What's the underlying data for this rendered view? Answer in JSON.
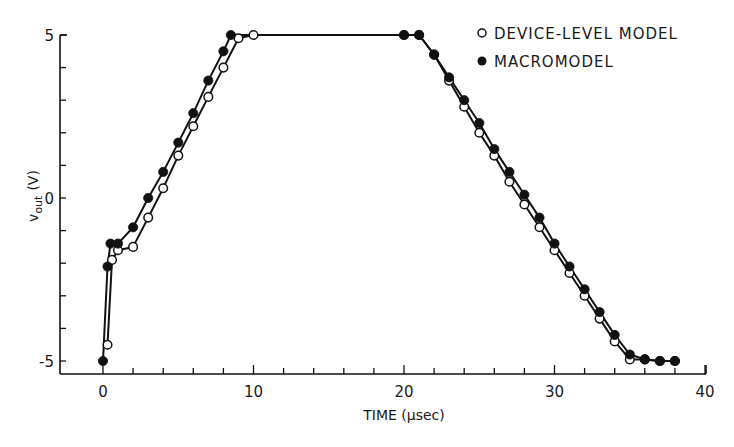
{
  "chart_data": {
    "type": "line",
    "title": "",
    "xlabel": "TIME (μsec)",
    "ylabel": "vout (V)",
    "ylabel_main": "v",
    "ylabel_sub": "out",
    "ylabel_unit": "(V)",
    "xlim": [
      0,
      40
    ],
    "ylim": [
      -5,
      5
    ],
    "x_ticks": [
      0,
      10,
      20,
      30,
      40
    ],
    "x_tick_labels": [
      "0",
      "10",
      "20",
      "30",
      "40"
    ],
    "x_minor_step": 2,
    "y_ticks": [
      -5,
      0,
      5
    ],
    "y_tick_labels": [
      "-5",
      "0",
      "5"
    ],
    "y_minor_step": 1,
    "grid": false,
    "legend_position": "upper right",
    "series": [
      {
        "name": "DEVICE-LEVEL MODEL",
        "marker": "open-circle",
        "x": [
          0.3,
          0.6,
          1,
          2,
          3,
          4,
          5,
          6,
          7,
          8,
          9,
          10,
          20,
          21,
          22,
          23,
          24,
          25,
          26,
          27,
          28,
          29,
          30,
          31,
          32,
          33,
          34,
          35,
          36,
          37,
          38
        ],
        "y": [
          -4.5,
          -1.9,
          -1.6,
          -1.5,
          -0.6,
          0.3,
          1.3,
          2.2,
          3.1,
          4.0,
          4.9,
          5.0,
          5.0,
          5.0,
          4.4,
          3.6,
          2.8,
          2.0,
          1.3,
          0.5,
          -0.2,
          -0.9,
          -1.6,
          -2.3,
          -3.0,
          -3.7,
          -4.4,
          -4.95,
          -4.95,
          -5.0,
          -5.0
        ]
      },
      {
        "name": "MACROMODEL",
        "marker": "filled-circle",
        "x": [
          0,
          0.3,
          0.5,
          1,
          2,
          3,
          4,
          5,
          6,
          7,
          8,
          8.5,
          20,
          21,
          22,
          23,
          24,
          25,
          26,
          27,
          28,
          29,
          30,
          31,
          32,
          33,
          34,
          35,
          36,
          37,
          38
        ],
        "y": [
          -5.0,
          -2.1,
          -1.4,
          -1.4,
          -0.9,
          0.0,
          0.8,
          1.7,
          2.6,
          3.6,
          4.5,
          5.0,
          5.0,
          5.0,
          4.4,
          3.7,
          3.0,
          2.3,
          1.5,
          0.8,
          0.1,
          -0.6,
          -1.4,
          -2.1,
          -2.8,
          -3.5,
          -4.2,
          -4.8,
          -4.95,
          -5.0,
          -5.0
        ]
      }
    ]
  },
  "legend": {
    "items": [
      {
        "label": "DEVICE-LEVEL MODEL",
        "marker": "open-circle"
      },
      {
        "label": "MACROMODEL",
        "marker": "filled-circle"
      }
    ]
  },
  "colors": {
    "ink": "#111111",
    "background": "#ffffff"
  }
}
